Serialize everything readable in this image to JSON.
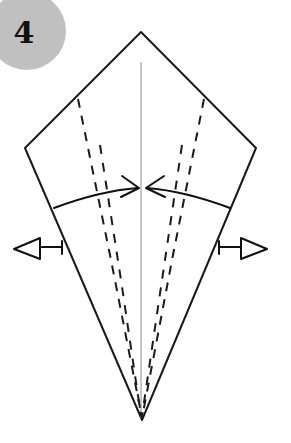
{
  "page": {
    "width": 291,
    "height": 443,
    "background_color": "#ffffff"
  },
  "step_badge": {
    "number": "4",
    "shape": "circle",
    "fill_color": "#c0c0c0",
    "text_color": "#111111",
    "center_x": 27,
    "center_y": 31,
    "radius": 39,
    "font_size": 30
  },
  "figure": {
    "name": "kite-base",
    "stroke_color": "#1a1a1a",
    "fill_color": "#ffffff",
    "outline_width": 2,
    "outline_points": "141,32 256,148 142,420 25,148",
    "vertices": {
      "top": {
        "x": 141,
        "y": 32
      },
      "right": {
        "x": 256,
        "y": 148
      },
      "bottom": {
        "x": 142,
        "y": 420
      },
      "left": {
        "x": 25,
        "y": 148
      }
    }
  },
  "center_line": {
    "name": "vertical-center-crease",
    "color": "#8a8a8a",
    "width": 1,
    "x": 141,
    "y_start": 62,
    "y_end": 418
  },
  "crease_lines": [
    {
      "name": "left-crease-outer",
      "style": "dashed",
      "color": "#1a1a1a",
      "width": 2,
      "dash": "9 8",
      "points": "78,99 110,255 142,418"
    },
    {
      "name": "right-crease-outer",
      "style": "dashed",
      "color": "#1a1a1a",
      "width": 2,
      "dash": "9 8",
      "points": "204,99 173,255 142,418"
    },
    {
      "name": "left-crease-inner",
      "style": "dashed",
      "color": "#1a1a1a",
      "width": 2,
      "dash": "9 9",
      "points": "100,145 121,280 141,416"
    },
    {
      "name": "right-crease-inner",
      "style": "dashed",
      "color": "#1a1a1a",
      "width": 2,
      "dash": "9 9",
      "points": "182,145 162,280 142,416"
    }
  ],
  "fold_arrows": [
    {
      "name": "fold-arrow-left-inward",
      "direction": "right",
      "type": "curved-open-arrow",
      "color": "#111111",
      "width": 2,
      "path": "M 54,208 C 86,196 112,190 138,188",
      "head": "122,176 139,188 121,197",
      "tip_x": 139,
      "tip_y": 188
    },
    {
      "name": "fold-arrow-right-inward",
      "direction": "left",
      "type": "curved-open-arrow",
      "color": "#111111",
      "width": 2,
      "path": "M 230,208 C 198,196 172,190 147,188",
      "head": "164,176 146,188 165,197",
      "tip_x": 146,
      "tip_y": 188
    }
  ],
  "pull_arrows": [
    {
      "name": "pull-arrow-left-outward",
      "direction": "left",
      "type": "hollow-triangle-arrow",
      "color": "#111111",
      "fill": "#ffffff",
      "width": 2,
      "stem": "M 62,247 L 40,247",
      "triangle": "40,238 14,249 40,259",
      "anchor_x": 62,
      "anchor_y": 247
    },
    {
      "name": "pull-arrow-right-outward",
      "direction": "right",
      "type": "hollow-triangle-arrow",
      "color": "#111111",
      "fill": "#ffffff",
      "width": 2,
      "stem": "M 219,247 L 241,247",
      "triangle": "241,238 267,249 241,259",
      "anchor_x": 219,
      "anchor_y": 247
    }
  ],
  "tick_marks": [
    {
      "name": "left-edge-tick",
      "points": "62,241 62,254",
      "color": "#111111"
    },
    {
      "name": "right-edge-tick",
      "points": "219,241 219,254",
      "color": "#111111"
    }
  ]
}
